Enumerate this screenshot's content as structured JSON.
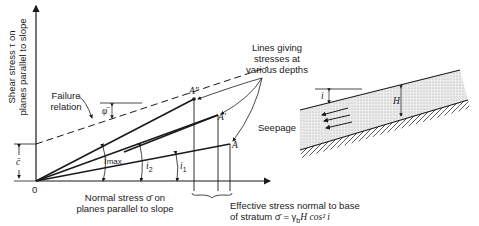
{
  "left_diagram": {
    "y_axis_label_line1": "Shear stress τ on",
    "y_axis_label_line2": "planes parallel to slope",
    "x_axis_label_line1": "Normal stress σ̄ on",
    "x_axis_label_line2": "planes parallel to slope",
    "origin_label": "0",
    "cohesion_label": "c̄",
    "failure_label_line1": "Failure",
    "failure_label_line2": "relation",
    "friction_angle_label": "φ̄",
    "lines_label_line1": "Lines giving",
    "lines_label_line2": "stresses at",
    "lines_label_line3": "various depths",
    "point_a_double_prime": "A″",
    "point_a_prime": "A′",
    "point_a": "A",
    "angle_i_max": "i",
    "angle_i_max_sub": "max",
    "angle_i2": "i",
    "angle_i2_sub": "2",
    "angle_i1": "i",
    "angle_i1_sub": "1",
    "effective_stress_line1": "Effective stress normal to base",
    "effective_stress_line2": "of stratum σ̄ = γ",
    "effective_stress_sub": "b",
    "effective_stress_tail": "H cos² i"
  },
  "right_diagram": {
    "slope_angle_label": "i",
    "thickness_label": "H",
    "seepage_label": "Seepage"
  }
}
